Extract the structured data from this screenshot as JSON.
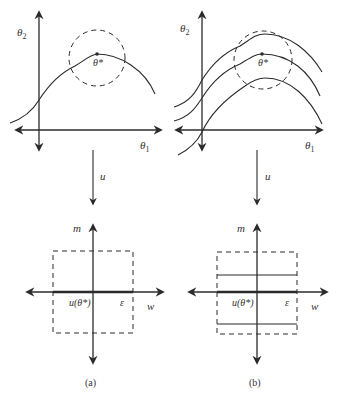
{
  "panels": [
    {
      "id": "a",
      "caption": "(a)",
      "top": {
        "y_axis_label": "θ2",
        "x_axis_label": "θ1",
        "optimum_label": "θ*",
        "curve_count": 1
      },
      "mapping_label": "u",
      "bottom": {
        "y_axis_label": "m",
        "x_axis_label": "w",
        "origin_label": "u(θ*)",
        "edge_label": "ε",
        "horizontal_segments": 1
      }
    },
    {
      "id": "b",
      "caption": "(b)",
      "top": {
        "y_axis_label": "θ2",
        "x_axis_label": "θ1",
        "optimum_label": "θ*",
        "curve_count": 3
      },
      "mapping_label": "u",
      "bottom": {
        "y_axis_label": "m",
        "x_axis_label": "w",
        "origin_label": "u(θ*)",
        "edge_label": "ε",
        "horizontal_segments": 3
      }
    }
  ],
  "colors": {
    "stroke": "#2b2b2b",
    "background": "#ffffff",
    "text": "#333333"
  }
}
